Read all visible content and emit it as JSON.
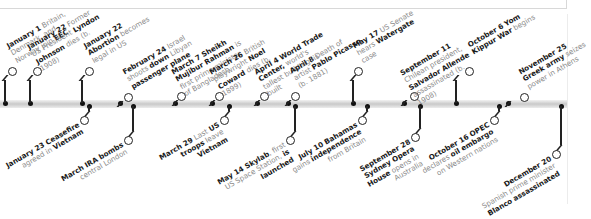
{
  "timeline": {
    "year_events_top": [
      {
        "date": "January 1",
        "text": "Britain, Denmark, and Norway join EEC",
        "bold": [
          "EEC"
        ],
        "bar_x": 5,
        "ring_x": 11,
        "ring_y": 70
      },
      {
        "date": "January 22",
        "text": "Former US President Lyndon Johnson dies (b. 1908)",
        "bold": [
          "Lyndon Johnson"
        ],
        "bar_x": 30,
        "ring_x": 36,
        "ring_y": 70
      },
      {
        "date": "January 22",
        "text": "Abortion becomes legal in US",
        "bold": [
          "Abortion"
        ],
        "bar_x": 82,
        "ring_x": 88,
        "ring_y": 70
      },
      {
        "date": "February 24",
        "text": "Israel shoots down Libyan passenger plane",
        "bold": [
          "down",
          "passenger plane"
        ],
        "bar_x": 120,
        "ring_x": 127,
        "ring_y": 96
      },
      {
        "date": "March 7",
        "text": "Sheikh Mujibur Rahman is first prime minister of Bangladesh",
        "bold": [
          "Sheikh Mujibur Rahman"
        ],
        "bar_x": 175,
        "ring_x": 180,
        "ring_y": 95
      },
      {
        "date": "March 26",
        "text": "British playwright Noel Coward dies (b. 1899)",
        "bold": [
          "Noel Coward"
        ],
        "bar_x": 212,
        "ring_x": 218,
        "ring_y": 95
      },
      {
        "date": "April 4",
        "text": "World Trade Center, world's tallest building, is built",
        "bold": [
          "World Trade Center,"
        ],
        "bar_x": 257,
        "ring_x": 263,
        "ring_y": 95
      },
      {
        "date": "April 8",
        "text": "Death of artist Pablo Picasso (b. 1881)",
        "bold": [
          "Pablo Picasso"
        ],
        "bar_x": 288,
        "ring_x": 294,
        "ring_y": 95
      },
      {
        "date": "May 17",
        "text": "US Senate hears Watergate case",
        "bold": [
          "Watergate"
        ],
        "bar_x": 353,
        "ring_x": 357,
        "ring_y": 70
      },
      {
        "date": "September 11",
        "text": "Chilean president, Salvador Allende assassinated (b. 1908)",
        "bold": [
          "Salvador Allende"
        ],
        "bar_x": 404,
        "ring_x": 413,
        "ring_y": 95
      },
      {
        "date": "October 6",
        "text": "Yom Kippur War begins",
        "bold": [
          "Yom Kippur War"
        ],
        "bar_x": 456,
        "ring_x": 468,
        "ring_y": 70
      },
      {
        "date": "November 25",
        "text": "Greek army seizes power in Athens",
        "bold": [
          "Greek army"
        ],
        "bar_x": 508,
        "ring_x": 523,
        "ring_y": 96
      }
    ],
    "year_events_bottom": [
      {
        "date": "January 23",
        "text": "Ceasefire agreed in Vietnam",
        "bold": [
          "Ceasefire",
          "Vietnam"
        ],
        "bar_x": 89,
        "ring_x": 83,
        "ring_y": 119
      },
      {
        "date": "March",
        "text": "IRA bombs central London",
        "bold": [
          "IRA bombs"
        ],
        "bar_x": 133,
        "ring_x": 127,
        "ring_y": 139
      },
      {
        "date": "March 29",
        "text": "Last US troops leave Vietnam",
        "bold": [
          "US troops",
          "Vietnam"
        ],
        "bar_x": 229,
        "ring_x": 223,
        "ring_y": 119
      },
      {
        "date": "May 14",
        "text": "Skylab, first US Space Station, is launched",
        "bold": [
          "Skylab",
          "is launched"
        ],
        "bar_x": 295,
        "ring_x": 289,
        "ring_y": 139
      },
      {
        "date": "July 10",
        "text": "Bahamas gains independence from Britain",
        "bold": [
          "Bahamas",
          "independence"
        ],
        "bar_x": 367,
        "ring_x": 361,
        "ring_y": 119
      },
      {
        "date": "September 28",
        "text": "Sydney Opera House opens in Australia",
        "bold": [
          "Sydney Opera House"
        ],
        "bar_x": 420,
        "ring_x": 414,
        "ring_y": 136
      },
      {
        "date": "October 16",
        "text": "OPEC declares oil embargo on Western nations",
        "bold": [
          "OPEC",
          "oil embargo"
        ],
        "bar_x": 499,
        "ring_x": 493,
        "ring_y": 119
      },
      {
        "date": "December 20",
        "text": "Spanish prime minister Blanco assassinated",
        "bold": [
          "Blanco",
          "assassinated"
        ],
        "bar_x": 561,
        "ring_x": 555,
        "ring_y": 153
      }
    ]
  },
  "colors": {
    "line": "#222222",
    "muted_text": "#8a8a8a",
    "bar": "#d0d0d0"
  }
}
